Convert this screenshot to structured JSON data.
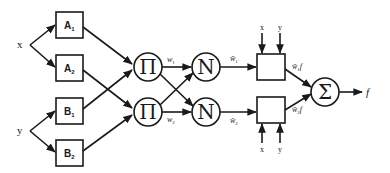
{
  "diagram": {
    "type": "ANFIS architecture",
    "inputs": [
      {
        "id": "x",
        "label": "x"
      },
      {
        "id": "y",
        "label": "y"
      }
    ],
    "layer1": [
      {
        "id": "A1",
        "label": "A",
        "sub": "1"
      },
      {
        "id": "A2",
        "label": "A",
        "sub": "2"
      },
      {
        "id": "B1",
        "label": "B",
        "sub": "1"
      },
      {
        "id": "B2",
        "label": "B",
        "sub": "2"
      }
    ],
    "layer2": [
      {
        "id": "P1",
        "symbol": "Π"
      },
      {
        "id": "P2",
        "symbol": "Π"
      }
    ],
    "layer2_outputs": [
      {
        "label": "w",
        "sub": "1"
      },
      {
        "label": "w",
        "sub": "2"
      }
    ],
    "layer3": [
      {
        "id": "N1",
        "symbol": "N"
      },
      {
        "id": "N2",
        "symbol": "N"
      }
    ],
    "layer3_outputs": [
      {
        "label": "w̄",
        "sub": "1"
      },
      {
        "label": "w̄",
        "sub": "2"
      }
    ],
    "layer4": {
      "top_inputs": [
        "x",
        "y"
      ],
      "bottom_inputs": [
        "x",
        "y"
      ],
      "outputs": [
        {
          "label": "w̄",
          "sub": "1",
          "suffix": "f"
        },
        {
          "label": "w̄",
          "sub": "2",
          "suffix": "f"
        }
      ]
    },
    "layer5": {
      "symbol": "Σ",
      "output": "f"
    }
  }
}
